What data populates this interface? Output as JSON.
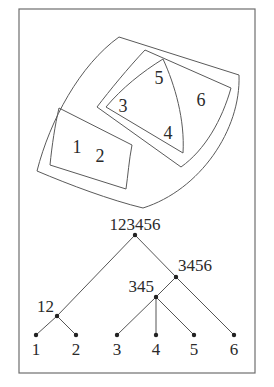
{
  "venn": {
    "regions": [
      {
        "id": "123456",
        "members": [
          "1",
          "2",
          "3",
          "4",
          "5",
          "6"
        ]
      },
      {
        "id": "12",
        "members": [
          "1",
          "2"
        ]
      },
      {
        "id": "3456",
        "members": [
          "3",
          "4",
          "5",
          "6"
        ]
      },
      {
        "id": "345",
        "members": [
          "3",
          "4",
          "5"
        ]
      }
    ],
    "labels": [
      {
        "text": "1",
        "x": 77,
        "y": 153
      },
      {
        "text": "2",
        "x": 100,
        "y": 162
      },
      {
        "text": "3",
        "x": 123,
        "y": 112
      },
      {
        "text": "4",
        "x": 168,
        "y": 139
      },
      {
        "text": "5",
        "x": 159,
        "y": 84
      },
      {
        "text": "6",
        "x": 201,
        "y": 106
      }
    ]
  },
  "tree": {
    "nodes": [
      {
        "id": "123456",
        "label": "123456",
        "x": 135,
        "y": 235,
        "lx": 135,
        "ly": 230,
        "anchor": "middle"
      },
      {
        "id": "3456",
        "label": "3456",
        "x": 176,
        "y": 277,
        "lx": 178,
        "ly": 271,
        "anchor": "start"
      },
      {
        "id": "345",
        "label": "345",
        "x": 156,
        "y": 297,
        "lx": 154,
        "ly": 292,
        "anchor": "end"
      },
      {
        "id": "12",
        "label": "12",
        "x": 57,
        "y": 316,
        "lx": 54,
        "ly": 312,
        "anchor": "end"
      },
      {
        "id": "1",
        "label": "1",
        "x": 36,
        "y": 335,
        "lx": 36,
        "ly": 355,
        "anchor": "middle"
      },
      {
        "id": "2",
        "label": "2",
        "x": 76,
        "y": 335,
        "lx": 76,
        "ly": 355,
        "anchor": "middle"
      },
      {
        "id": "3",
        "label": "3",
        "x": 117,
        "y": 335,
        "lx": 117,
        "ly": 355,
        "anchor": "middle"
      },
      {
        "id": "4",
        "label": "4",
        "x": 156,
        "y": 335,
        "lx": 156,
        "ly": 355,
        "anchor": "middle"
      },
      {
        "id": "5",
        "label": "5",
        "x": 194,
        "y": 335,
        "lx": 194,
        "ly": 355,
        "anchor": "middle"
      },
      {
        "id": "6",
        "label": "6",
        "x": 234,
        "y": 335,
        "lx": 234,
        "ly": 355,
        "anchor": "middle"
      }
    ],
    "edges": [
      [
        "123456",
        "12"
      ],
      [
        "123456",
        "3456"
      ],
      [
        "3456",
        "345"
      ],
      [
        "3456",
        "6"
      ],
      [
        "345",
        "3"
      ],
      [
        "345",
        "4"
      ],
      [
        "345",
        "5"
      ],
      [
        "12",
        "1"
      ],
      [
        "12",
        "2"
      ]
    ]
  }
}
